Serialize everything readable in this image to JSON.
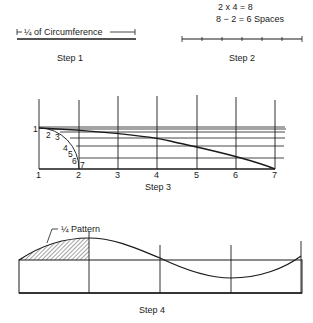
{
  "step1": {
    "measure_label": "¼ of Circumference",
    "caption": "Step 1"
  },
  "step2": {
    "equation_1": "2 x 4 = 8",
    "equation_2": "8 − 2 = 6 Spaces",
    "caption": "Step 2",
    "divisions": 6
  },
  "step3": {
    "caption": "Step 3",
    "bottom_labels": [
      "1",
      "2",
      "3",
      "4",
      "5",
      "6",
      "7"
    ],
    "arc_labels": [
      "1",
      "2",
      "3",
      "4",
      "5",
      "6",
      "7"
    ]
  },
  "step4": {
    "pattern_label": "¼ Pattern",
    "caption": "Step 4"
  },
  "colors": {
    "ink": "#1a1a1a",
    "background": "#ffffff"
  }
}
